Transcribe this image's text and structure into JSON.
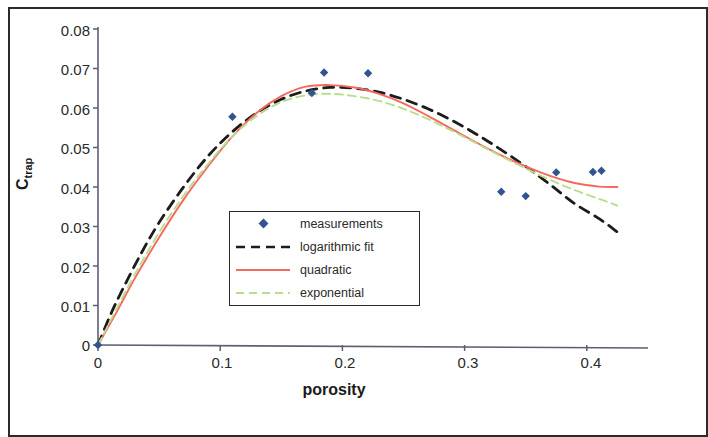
{
  "chart_data": {
    "type": "scatter",
    "title": "",
    "xlabel": "porosity",
    "ylabel": "C_trap",
    "ylabel_base": "C",
    "ylabel_sub": "trap",
    "xlim": [
      0,
      0.455
    ],
    "ylim": [
      0,
      0.08
    ],
    "xticks": [
      0,
      0.1,
      0.2,
      0.3,
      0.4
    ],
    "xticklabels": [
      "0",
      "0.1",
      "0.2",
      "0.3",
      "0.4"
    ],
    "yticks": [
      0,
      0.01,
      0.02,
      0.03,
      0.04,
      0.05,
      0.06,
      0.07,
      0.08
    ],
    "yticklabels": [
      "0",
      "0.01",
      "0.02",
      "0.03",
      "0.04",
      "0.05",
      "0.06",
      "0.07",
      "0.08"
    ],
    "grid": false,
    "legend_position": "center",
    "series": [
      {
        "name": "measurements",
        "type": "scatter",
        "marker": "diamond",
        "color": "#31538f",
        "points": [
          {
            "x": 0.0,
            "y": 0.0
          },
          {
            "x": 0.11,
            "y": 0.0578
          },
          {
            "x": 0.175,
            "y": 0.0638
          },
          {
            "x": 0.185,
            "y": 0.069
          },
          {
            "x": 0.221,
            "y": 0.0688
          },
          {
            "x": 0.33,
            "y": 0.0388
          },
          {
            "x": 0.35,
            "y": 0.0377
          },
          {
            "x": 0.375,
            "y": 0.0437
          },
          {
            "x": 0.405,
            "y": 0.0438
          },
          {
            "x": 0.412,
            "y": 0.0441
          }
        ]
      },
      {
        "name": "logarithmic fit",
        "type": "line",
        "style": "dashed",
        "color": "#1c1c1c",
        "points": [
          {
            "x": 0.0,
            "y": 0.0
          },
          {
            "x": 0.01,
            "y": 0.0075
          },
          {
            "x": 0.02,
            "y": 0.014
          },
          {
            "x": 0.035,
            "y": 0.023
          },
          {
            "x": 0.05,
            "y": 0.031
          },
          {
            "x": 0.07,
            "y": 0.04
          },
          {
            "x": 0.09,
            "y": 0.0478
          },
          {
            "x": 0.11,
            "y": 0.054
          },
          {
            "x": 0.13,
            "y": 0.0588
          },
          {
            "x": 0.15,
            "y": 0.0622
          },
          {
            "x": 0.17,
            "y": 0.0643
          },
          {
            "x": 0.19,
            "y": 0.0652
          },
          {
            "x": 0.21,
            "y": 0.065
          },
          {
            "x": 0.23,
            "y": 0.064
          },
          {
            "x": 0.25,
            "y": 0.0622
          },
          {
            "x": 0.27,
            "y": 0.0598
          },
          {
            "x": 0.29,
            "y": 0.0568
          },
          {
            "x": 0.31,
            "y": 0.0533
          },
          {
            "x": 0.33,
            "y": 0.0494
          },
          {
            "x": 0.35,
            "y": 0.0452
          },
          {
            "x": 0.37,
            "y": 0.0406
          },
          {
            "x": 0.39,
            "y": 0.0358
          },
          {
            "x": 0.41,
            "y": 0.032
          },
          {
            "x": 0.425,
            "y": 0.0286
          }
        ]
      },
      {
        "name": "quadratic",
        "type": "line",
        "style": "solid",
        "color": "#f5685e",
        "points": [
          {
            "x": 0.0,
            "y": 0.0
          },
          {
            "x": 0.015,
            "y": 0.0082
          },
          {
            "x": 0.03,
            "y": 0.0168
          },
          {
            "x": 0.05,
            "y": 0.0272
          },
          {
            "x": 0.07,
            "y": 0.0368
          },
          {
            "x": 0.09,
            "y": 0.0452
          },
          {
            "x": 0.11,
            "y": 0.0528
          },
          {
            "x": 0.13,
            "y": 0.0588
          },
          {
            "x": 0.15,
            "y": 0.063
          },
          {
            "x": 0.17,
            "y": 0.0654
          },
          {
            "x": 0.19,
            "y": 0.0658
          },
          {
            "x": 0.21,
            "y": 0.0652
          },
          {
            "x": 0.23,
            "y": 0.0636
          },
          {
            "x": 0.25,
            "y": 0.0612
          },
          {
            "x": 0.27,
            "y": 0.058
          },
          {
            "x": 0.29,
            "y": 0.0546
          },
          {
            "x": 0.31,
            "y": 0.0512
          },
          {
            "x": 0.33,
            "y": 0.048
          },
          {
            "x": 0.35,
            "y": 0.0452
          },
          {
            "x": 0.37,
            "y": 0.0428
          },
          {
            "x": 0.39,
            "y": 0.041
          },
          {
            "x": 0.41,
            "y": 0.0401
          },
          {
            "x": 0.425,
            "y": 0.04
          }
        ]
      },
      {
        "name": "exponential",
        "type": "line",
        "style": "dashed",
        "color": "#b9dd8f",
        "points": [
          {
            "x": 0.0,
            "y": 0.0
          },
          {
            "x": 0.015,
            "y": 0.009
          },
          {
            "x": 0.03,
            "y": 0.0178
          },
          {
            "x": 0.05,
            "y": 0.0285
          },
          {
            "x": 0.07,
            "y": 0.0378
          },
          {
            "x": 0.09,
            "y": 0.0458
          },
          {
            "x": 0.11,
            "y": 0.0528
          },
          {
            "x": 0.13,
            "y": 0.058
          },
          {
            "x": 0.15,
            "y": 0.0615
          },
          {
            "x": 0.17,
            "y": 0.0632
          },
          {
            "x": 0.19,
            "y": 0.0636
          },
          {
            "x": 0.21,
            "y": 0.063
          },
          {
            "x": 0.23,
            "y": 0.0618
          },
          {
            "x": 0.25,
            "y": 0.0598
          },
          {
            "x": 0.27,
            "y": 0.0572
          },
          {
            "x": 0.29,
            "y": 0.0542
          },
          {
            "x": 0.31,
            "y": 0.051
          },
          {
            "x": 0.33,
            "y": 0.0478
          },
          {
            "x": 0.35,
            "y": 0.0447
          },
          {
            "x": 0.37,
            "y": 0.0418
          },
          {
            "x": 0.39,
            "y": 0.0392
          },
          {
            "x": 0.41,
            "y": 0.037
          },
          {
            "x": 0.425,
            "y": 0.0353
          }
        ]
      }
    ]
  },
  "axes": {
    "x_title": "porosity",
    "y_title_base": "C",
    "y_title_sub": "trap"
  },
  "legend": {
    "entries": [
      {
        "label": "measurements",
        "marker": "diamond",
        "color": "#31538f"
      },
      {
        "label": "logarithmic fit",
        "marker": "dashed-line",
        "color": "#1c1c1c"
      },
      {
        "label": "quadratic",
        "marker": "solid-line",
        "color": "#f5685e"
      },
      {
        "label": "exponential",
        "marker": "dashed-line",
        "color": "#b9dd8f"
      }
    ]
  }
}
